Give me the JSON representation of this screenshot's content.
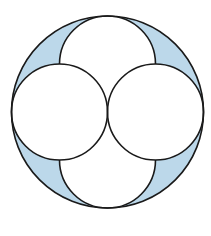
{
  "diagram": {
    "colors": {
      "shade": "#bcd8ea",
      "stroke": "#1a1a1a",
      "background": "#ffffff"
    },
    "small_circles": [
      "left",
      "right",
      "top",
      "bottom"
    ],
    "shaded_regions": 4
  }
}
